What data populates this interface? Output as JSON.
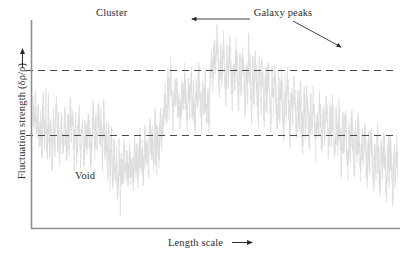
{
  "figure": {
    "background_color": "#ffffff",
    "axis_color": "#8a8a8a",
    "text_color": "#2b2b2b",
    "trace_color": "#dcdcdc",
    "dashed_line_color": "#4a4a4a"
  },
  "labels": {
    "y_axis": "Fluctuation strength (δρ/ρ)",
    "x_axis": "Length scale",
    "cluster": "Cluster",
    "void": "Void",
    "galaxy_peaks": "Galaxy peaks"
  },
  "annotations": [
    {
      "name": "galaxy-peaks-arrow-left",
      "from_x": 250,
      "from_y": 19,
      "to_x": 192,
      "to_y": 19
    },
    {
      "name": "galaxy-peaks-arrow-diagonal",
      "from_x": 293,
      "from_y": 21,
      "to_x": 341,
      "to_y": 47
    }
  ],
  "chart_data": {
    "type": "line",
    "title": "",
    "xlabel": "Length scale",
    "ylabel": "Fluctuation strength (δρ/ρ)",
    "xlim": [
      0,
      1
    ],
    "ylim": [
      0,
      1
    ],
    "grid": false,
    "legend": "none",
    "axis_ticks": "none",
    "reference_lines": [
      {
        "name": "upper-threshold",
        "y_px": 70,
        "style": "dashed",
        "label": "cluster threshold"
      },
      {
        "name": "lower-threshold",
        "y_px": 135,
        "style": "dashed",
        "label": "void threshold"
      }
    ],
    "plot_box_px": {
      "left": 31,
      "right": 400,
      "top": 10,
      "bottom": 228
    },
    "series": [
      {
        "name": "density fluctuation",
        "color": "#dcdcdc",
        "description": "Dense high-frequency noise trace oscillating about a mean, with upward spikes (galaxy peaks / clusters) exceeding the upper dashed threshold and downward excursions (voids) falling below the lower dashed threshold.",
        "values": [
          108,
          126,
          101,
          134,
          112,
          141,
          118,
          150,
          104,
          137,
          122,
          158,
          110,
          145,
          129,
          163,
          116,
          152,
          107,
          140,
          124,
          161,
          113,
          149,
          131,
          118,
          155,
          126,
          143,
          109,
          136,
          120,
          157,
          111,
          148,
          133,
          117,
          154,
          125,
          142,
          160,
          128,
          147,
          119,
          138,
          156,
          130,
          112,
          151,
          123,
          144,
          105,
          135,
          121,
          159,
          114,
          146,
          132,
          168,
          127,
          178,
          139,
          185,
          150,
          172,
          161,
          190,
          155,
          176,
          166,
          182,
          148,
          170,
          159,
          187,
          152,
          174,
          163,
          181,
          145,
          167,
          157,
          179,
          141,
          164,
          153,
          175,
          136,
          158,
          147,
          169,
          130,
          151,
          140,
          162,
          124,
          145,
          134,
          156,
          118,
          139,
          128,
          110,
          96,
          118,
          84,
          106,
          72,
          98,
          116,
          88,
          104,
          78,
          112,
          92,
          120,
          86,
          108,
          76,
          100,
          118,
          90,
          106,
          80,
          114,
          94,
          122,
          88,
          110,
          74,
          102,
          120,
          92,
          108,
          82,
          116,
          96,
          124,
          70,
          58,
          82,
          44,
          66,
          36,
          60,
          88,
          52,
          74,
          40,
          64,
          92,
          56,
          78,
          46,
          70,
          98,
          60,
          84,
          50,
          72,
          100,
          62,
          86,
          54,
          76,
          104,
          66,
          90,
          58,
          80,
          108,
          68,
          94,
          61,
          83,
          112,
          71,
          97,
          64,
          88,
          116,
          75,
          101,
          68,
          92,
          120,
          79,
          105,
          72,
          96,
          124,
          83,
          109,
          76,
          100,
          128,
          87,
          113,
          80,
          104,
          132,
          91,
          117,
          84,
          108,
          136,
          95,
          121,
          88,
          112,
          140,
          99,
          125,
          92,
          116,
          144,
          103,
          129,
          96,
          120,
          148,
          107,
          133,
          100,
          124,
          152,
          111,
          137,
          104,
          128,
          156,
          115,
          141,
          108,
          132,
          160,
          119,
          145,
          112,
          136,
          164,
          123,
          149,
          116,
          140,
          168,
          127,
          153,
          120,
          144,
          172,
          131,
          157,
          124,
          148,
          176,
          135,
          161,
          128,
          152,
          180,
          139,
          165,
          132,
          156,
          184,
          143,
          169,
          136,
          160,
          188,
          147,
          173,
          140,
          164,
          192,
          151,
          177,
          144,
          168,
          196,
          155,
          181,
          148,
          172
        ]
      }
    ]
  }
}
